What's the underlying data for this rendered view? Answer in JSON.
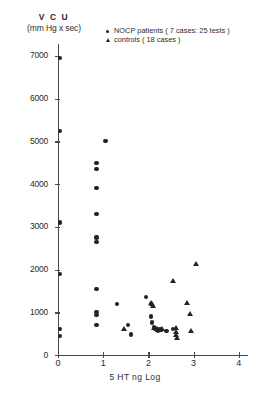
{
  "figure": {
    "y_title_line1": "V C U",
    "y_title_line2": "(mm Hg x sec)",
    "x_title": "5 HT  ng  Log"
  },
  "legend": {
    "entries": [
      {
        "marker": "circle-marker",
        "label": "NOCP patients ( 7 cases: 25 tests )"
      },
      {
        "marker": "triangle-marker",
        "label": "controls ( 18 cases )"
      }
    ]
  },
  "chart_data": {
    "type": "scatter",
    "title": "",
    "xlabel": "5 HT  ng  Log",
    "ylabel": "VCU (mm Hg x sec)",
    "xlim": [
      0,
      4
    ],
    "ylim": [
      0,
      7300
    ],
    "xticks": [
      0,
      1,
      2,
      3,
      4
    ],
    "yticks": [
      0,
      1000,
      2000,
      3000,
      4000,
      5000,
      6000,
      7000
    ],
    "grid": false,
    "legend_position": "top-right",
    "series": [
      {
        "name": "NOCP patients ( 7 cases: 25 tests )",
        "marker": "circle",
        "color": "#232323",
        "points": [
          [
            0.05,
            6950
          ],
          [
            0.05,
            5250
          ],
          [
            0.05,
            3100
          ],
          [
            0.05,
            1900
          ],
          [
            0.05,
            600
          ],
          [
            0.05,
            450
          ],
          [
            0.85,
            4500
          ],
          [
            0.85,
            4350
          ],
          [
            0.85,
            3900
          ],
          [
            0.85,
            3300
          ],
          [
            0.85,
            2750
          ],
          [
            0.85,
            2650
          ],
          [
            0.85,
            1550
          ],
          [
            0.85,
            1000
          ],
          [
            0.85,
            930
          ],
          [
            0.85,
            700
          ],
          [
            1.05,
            5000
          ],
          [
            1.3,
            1200
          ],
          [
            1.55,
            700
          ],
          [
            1.62,
            480
          ],
          [
            1.95,
            1350
          ],
          [
            2.05,
            900
          ],
          [
            2.08,
            760
          ],
          [
            2.12,
            660
          ],
          [
            2.15,
            620
          ],
          [
            2.18,
            600
          ],
          [
            2.2,
            580
          ],
          [
            2.22,
            560
          ],
          [
            2.25,
            610
          ],
          [
            2.4,
            560
          ],
          [
            2.55,
            600
          ]
        ]
      },
      {
        "name": "controls ( 18 cases )",
        "marker": "triangle",
        "color": "#232323",
        "points": [
          [
            1.45,
            620
          ],
          [
            2.05,
            1230
          ],
          [
            2.08,
            1210
          ],
          [
            2.1,
            1150
          ],
          [
            2.12,
            640
          ],
          [
            2.18,
            620
          ],
          [
            2.22,
            600
          ],
          [
            2.26,
            590
          ],
          [
            2.3,
            610
          ],
          [
            2.55,
            1750
          ],
          [
            2.6,
            640
          ],
          [
            2.6,
            540
          ],
          [
            2.62,
            470
          ],
          [
            2.64,
            400
          ],
          [
            2.85,
            1220
          ],
          [
            2.92,
            960
          ],
          [
            2.95,
            560
          ],
          [
            3.05,
            2130
          ]
        ]
      }
    ]
  }
}
